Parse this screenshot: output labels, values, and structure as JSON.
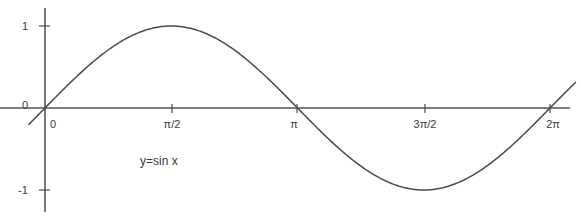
{
  "chart_data": {
    "type": "line",
    "title": "",
    "subtitle": "",
    "xlabel": "",
    "ylabel": "",
    "annotation": "y=sin x",
    "function": "y = sin x",
    "grid": false,
    "legend": false,
    "legend_position": "none",
    "xlim": [
      -0.2,
      6.6
    ],
    "ylim": [
      -1.3,
      1.3
    ],
    "x_tick_labels": [
      "0",
      "π/2",
      "π",
      "3π/2",
      "2π"
    ],
    "x_tick_values": [
      0,
      1.5708,
      3.1416,
      4.7124,
      6.2832
    ],
    "y_tick_labels": [
      "1",
      "0",
      "-1"
    ],
    "y_tick_values": [
      1,
      0,
      -1
    ],
    "origin_label": "0",
    "series": [
      {
        "name": "y=sin x",
        "color": "#4a4a4a",
        "x": [
          -0.2,
          0.0,
          0.3927,
          0.7854,
          1.1781,
          1.5708,
          1.9635,
          2.3562,
          2.7489,
          3.1416,
          3.5343,
          3.927,
          4.3197,
          4.7124,
          5.1051,
          5.4978,
          5.8905,
          6.2832,
          6.6
        ],
        "values": [
          -0.1987,
          0.0,
          0.3827,
          0.7071,
          0.9239,
          1.0,
          0.9239,
          0.7071,
          0.3827,
          0.0,
          -0.3827,
          -0.7071,
          -0.9239,
          -1.0,
          -0.9239,
          -0.7071,
          -0.3827,
          0.0,
          0.3115
        ]
      }
    ],
    "key_points": [
      {
        "label": "0",
        "x": 0,
        "y": 0
      },
      {
        "label": "maximum",
        "x": 1.5708,
        "y": 1
      },
      {
        "label": "zero",
        "x": 3.1416,
        "y": 0
      },
      {
        "label": "minimum",
        "x": 4.7124,
        "y": -1
      },
      {
        "label": "zero",
        "x": 6.2832,
        "y": 0
      }
    ]
  },
  "style": {
    "axis_color": "#555555",
    "curve_color": "#4a4a4a",
    "text_color": "#3a3a3a",
    "background": "#ffffff"
  }
}
